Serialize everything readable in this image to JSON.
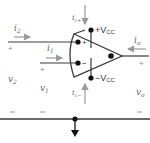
{
  "diagram": {
    "type": "op-amp terminal currents and voltages",
    "colors": {
      "wire": "#3a3a3a",
      "arrow": "#9a9a9a",
      "node": "#111111",
      "label": "#6a6a6a"
    },
    "labels": {
      "i2": "i",
      "i2_sub": "2",
      "i1": "i",
      "i1_sub": "1",
      "io": "i",
      "io_sub": "o",
      "ic_plus": "i",
      "ic_plus_sub": "c+",
      "ic_minus": "i",
      "ic_minus_sub": "c−",
      "vcc_plus": "+V",
      "vcc_plus_sub": "CC",
      "vcc_minus": "−V",
      "vcc_minus_sub": "CC",
      "v2": "v",
      "v2_sub": "2",
      "v1": "v",
      "v1_sub": "1",
      "vo": "v",
      "vo_sub": "o",
      "noninv_input": "+",
      "inv_input": "−",
      "plus_sign": "+",
      "minus_sign": "−"
    }
  }
}
